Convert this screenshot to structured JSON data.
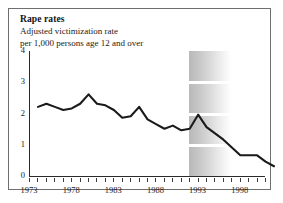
{
  "figure": {
    "title": "Rape rates",
    "subtitle_line1": "Adjusted victimization rate",
    "subtitle_line2": "per 1,000 persons age 12 and over"
  },
  "axes": {
    "y_ticks": [
      "4",
      "3",
      "2",
      "1",
      "0"
    ],
    "x_labels": [
      "1973",
      "1978",
      "1983",
      "1988",
      "1993",
      "1998"
    ]
  },
  "chart_data": {
    "type": "line",
    "title": "Rape rates",
    "subtitle": "Adjusted victimization rate per 1,000 persons age 12 and over",
    "xlabel": "",
    "ylabel": "Adjusted victimization rate per 1,000 persons age 12 and over",
    "ylim": [
      0,
      4
    ],
    "xlim": [
      1973,
      2001
    ],
    "yticks": [
      0,
      1,
      2,
      3,
      4
    ],
    "xticks": [
      1973,
      1978,
      1983,
      1988,
      1993,
      1998
    ],
    "xtick_interval": 1,
    "grid": false,
    "legend": "none",
    "line_color": "#1a1a1a",
    "shaded_region": {
      "label": "redesign transition band",
      "x_start": 1992,
      "x_end": 1997,
      "style": "gray-to-white horizontal gradient with white stripes at gridlines"
    },
    "x": [
      1973,
      1974,
      1975,
      1976,
      1977,
      1978,
      1979,
      1980,
      1981,
      1982,
      1983,
      1984,
      1985,
      1986,
      1987,
      1988,
      1989,
      1990,
      1991,
      1992,
      1993,
      1994,
      1995,
      1996,
      1997,
      1998,
      1999,
      2000,
      2001
    ],
    "values": [
      2.5,
      2.6,
      2.5,
      2.4,
      2.45,
      2.6,
      2.9,
      2.6,
      2.55,
      2.4,
      2.15,
      2.2,
      2.5,
      2.1,
      1.95,
      1.8,
      1.9,
      1.75,
      1.8,
      2.25,
      1.85,
      1.65,
      1.45,
      1.2,
      0.95,
      0.95,
      0.95,
      0.75,
      0.6
    ]
  }
}
